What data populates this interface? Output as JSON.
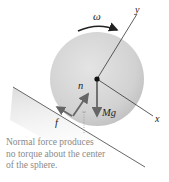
{
  "figure": {
    "labels": {
      "omega": "ω",
      "y_axis": "y",
      "x_axis": "x",
      "normal_force": "n",
      "friction_force": "f",
      "weight": "Mg"
    },
    "caption": {
      "lines": [
        "Normal force produces",
        "no torque about the center",
        "of the sphere."
      ]
    },
    "colors": {
      "sphere_fill": "#cfcfcf",
      "incline_line": "#555555",
      "incline_shade": "#e6e6e6",
      "arrow": "#666666",
      "caption_text": "#8a8a8a"
    }
  }
}
